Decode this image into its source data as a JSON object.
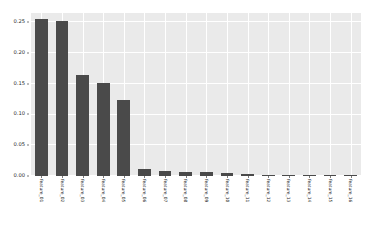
{
  "chart_data": {
    "type": "bar",
    "title": "",
    "subtitle": "",
    "xlabel": "",
    "ylabel": "",
    "orientation": "vertical",
    "style": "seaborn-darkgrid",
    "grid": true,
    "legend": null,
    "legend_position": "none",
    "ylim": [
      0.0,
      0.265
    ],
    "ytick_labels": [
      "0.00",
      "0.05",
      "0.10",
      "0.15",
      "0.20",
      "0.25"
    ],
    "ytick_values": [
      0.0,
      0.05,
      0.1,
      0.15,
      0.2,
      0.25
    ],
    "bar_color": "#4a4a4a",
    "panel_color": "#eaeaea",
    "grid_color": "#ffffff",
    "figure_color": "#ffffff",
    "categories": [
      "feature_01",
      "feature_02",
      "feature_03",
      "feature_04",
      "feature_05",
      "feature_06",
      "feature_07",
      "feature_08",
      "feature_09",
      "feature_10",
      "feature_11",
      "feature_12",
      "feature_13",
      "feature_14",
      "feature_15",
      "feature_16"
    ],
    "values": [
      0.255,
      0.252,
      0.165,
      0.152,
      0.124,
      0.012,
      0.008,
      0.006,
      0.006,
      0.005,
      0.003,
      0.002,
      0.002,
      0.0015,
      0.001,
      0.0008
    ]
  }
}
